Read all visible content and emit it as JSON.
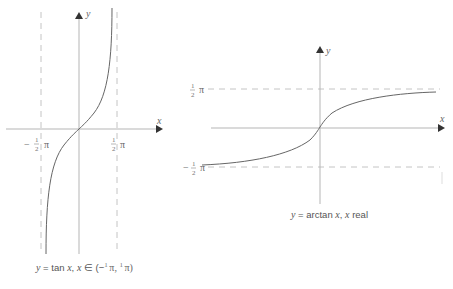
{
  "left_graph": {
    "x_axis_label": "x",
    "y_axis_label": "y",
    "tick_left": {
      "sign": "−",
      "num": "1",
      "den": "2",
      "pi": "π"
    },
    "tick_right": {
      "num": "1",
      "den": "2",
      "pi": "π"
    },
    "caption": {
      "y": "y",
      "eq": " = tan ",
      "x1": "x",
      "comma": ",  ",
      "x2": "x",
      "in": " ∈ (−",
      "n1": "1",
      "d1": "2",
      "pi1": " π, ",
      "n2": "1",
      "d2": "2",
      "pi2": " π)"
    }
  },
  "right_graph": {
    "x_axis_label": "x",
    "y_axis_label": "y",
    "tick_top": {
      "num": "1",
      "den": "2",
      "pi": "π"
    },
    "tick_bottom": {
      "sign": "−",
      "num": "1",
      "den": "2",
      "pi": "π"
    },
    "caption": {
      "y": "y",
      "eq": " = arctan ",
      "x1": "x",
      "comma": ", ",
      "x2": "x",
      "tail": " real"
    }
  },
  "colors": {
    "axis": "#b0b0b0",
    "curve": "#666666",
    "dash": "#bdbdbd",
    "arrow": "#333333"
  }
}
